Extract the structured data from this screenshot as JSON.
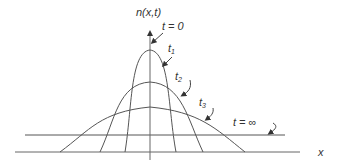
{
  "diagram": {
    "y_axis_label": "n(x,t)",
    "x_axis_label": "x",
    "curves": [
      {
        "label": "t = 0",
        "label_main": "t = 0"
      },
      {
        "label": "t1",
        "label_main": "t",
        "label_sub": "1"
      },
      {
        "label": "t2",
        "label_main": "t",
        "label_sub": "2"
      },
      {
        "label": "t3",
        "label_main": "t",
        "label_sub": "3"
      },
      {
        "label": "t = ∞",
        "label_main": "t = ∞"
      }
    ],
    "stroke_color": "#555555",
    "background": "#ffffff"
  }
}
